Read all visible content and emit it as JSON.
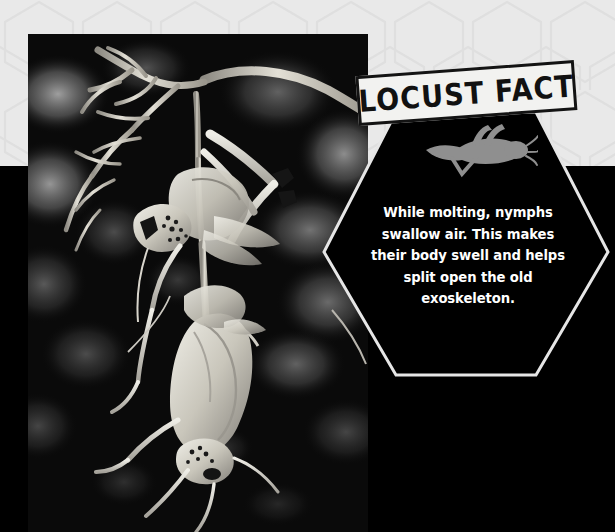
{
  "page": {
    "title": "Locust Fact",
    "background_light": "#e9e9e9",
    "background_dark": "#000000"
  },
  "photo": {
    "alt": "Black and white photograph of a locust nymph molting while hanging upside down from a dry twig",
    "subject": "molting locust nymph on branch",
    "palette": "black-and-white"
  },
  "banner": {
    "label": "LOCUST FACT",
    "text_color": "#111111",
    "fill_color": "#f2f2f0",
    "border_color": "#131313"
  },
  "hexagon": {
    "fill_color": "#000000",
    "outline_color": "#e6e6e6",
    "icon_name": "locust-silhouette-icon",
    "icon_color": "#8f8f8f",
    "fact_text": "While molting, nymphs swallow air. This makes their body swell and helps split open the old exoskeleton.",
    "fact_lines": [
      "While molting, nymphs",
      "swallow air. This makes their",
      "body swell and helps split",
      "open the old exoskeleton."
    ],
    "text_color": "#ffffff"
  }
}
